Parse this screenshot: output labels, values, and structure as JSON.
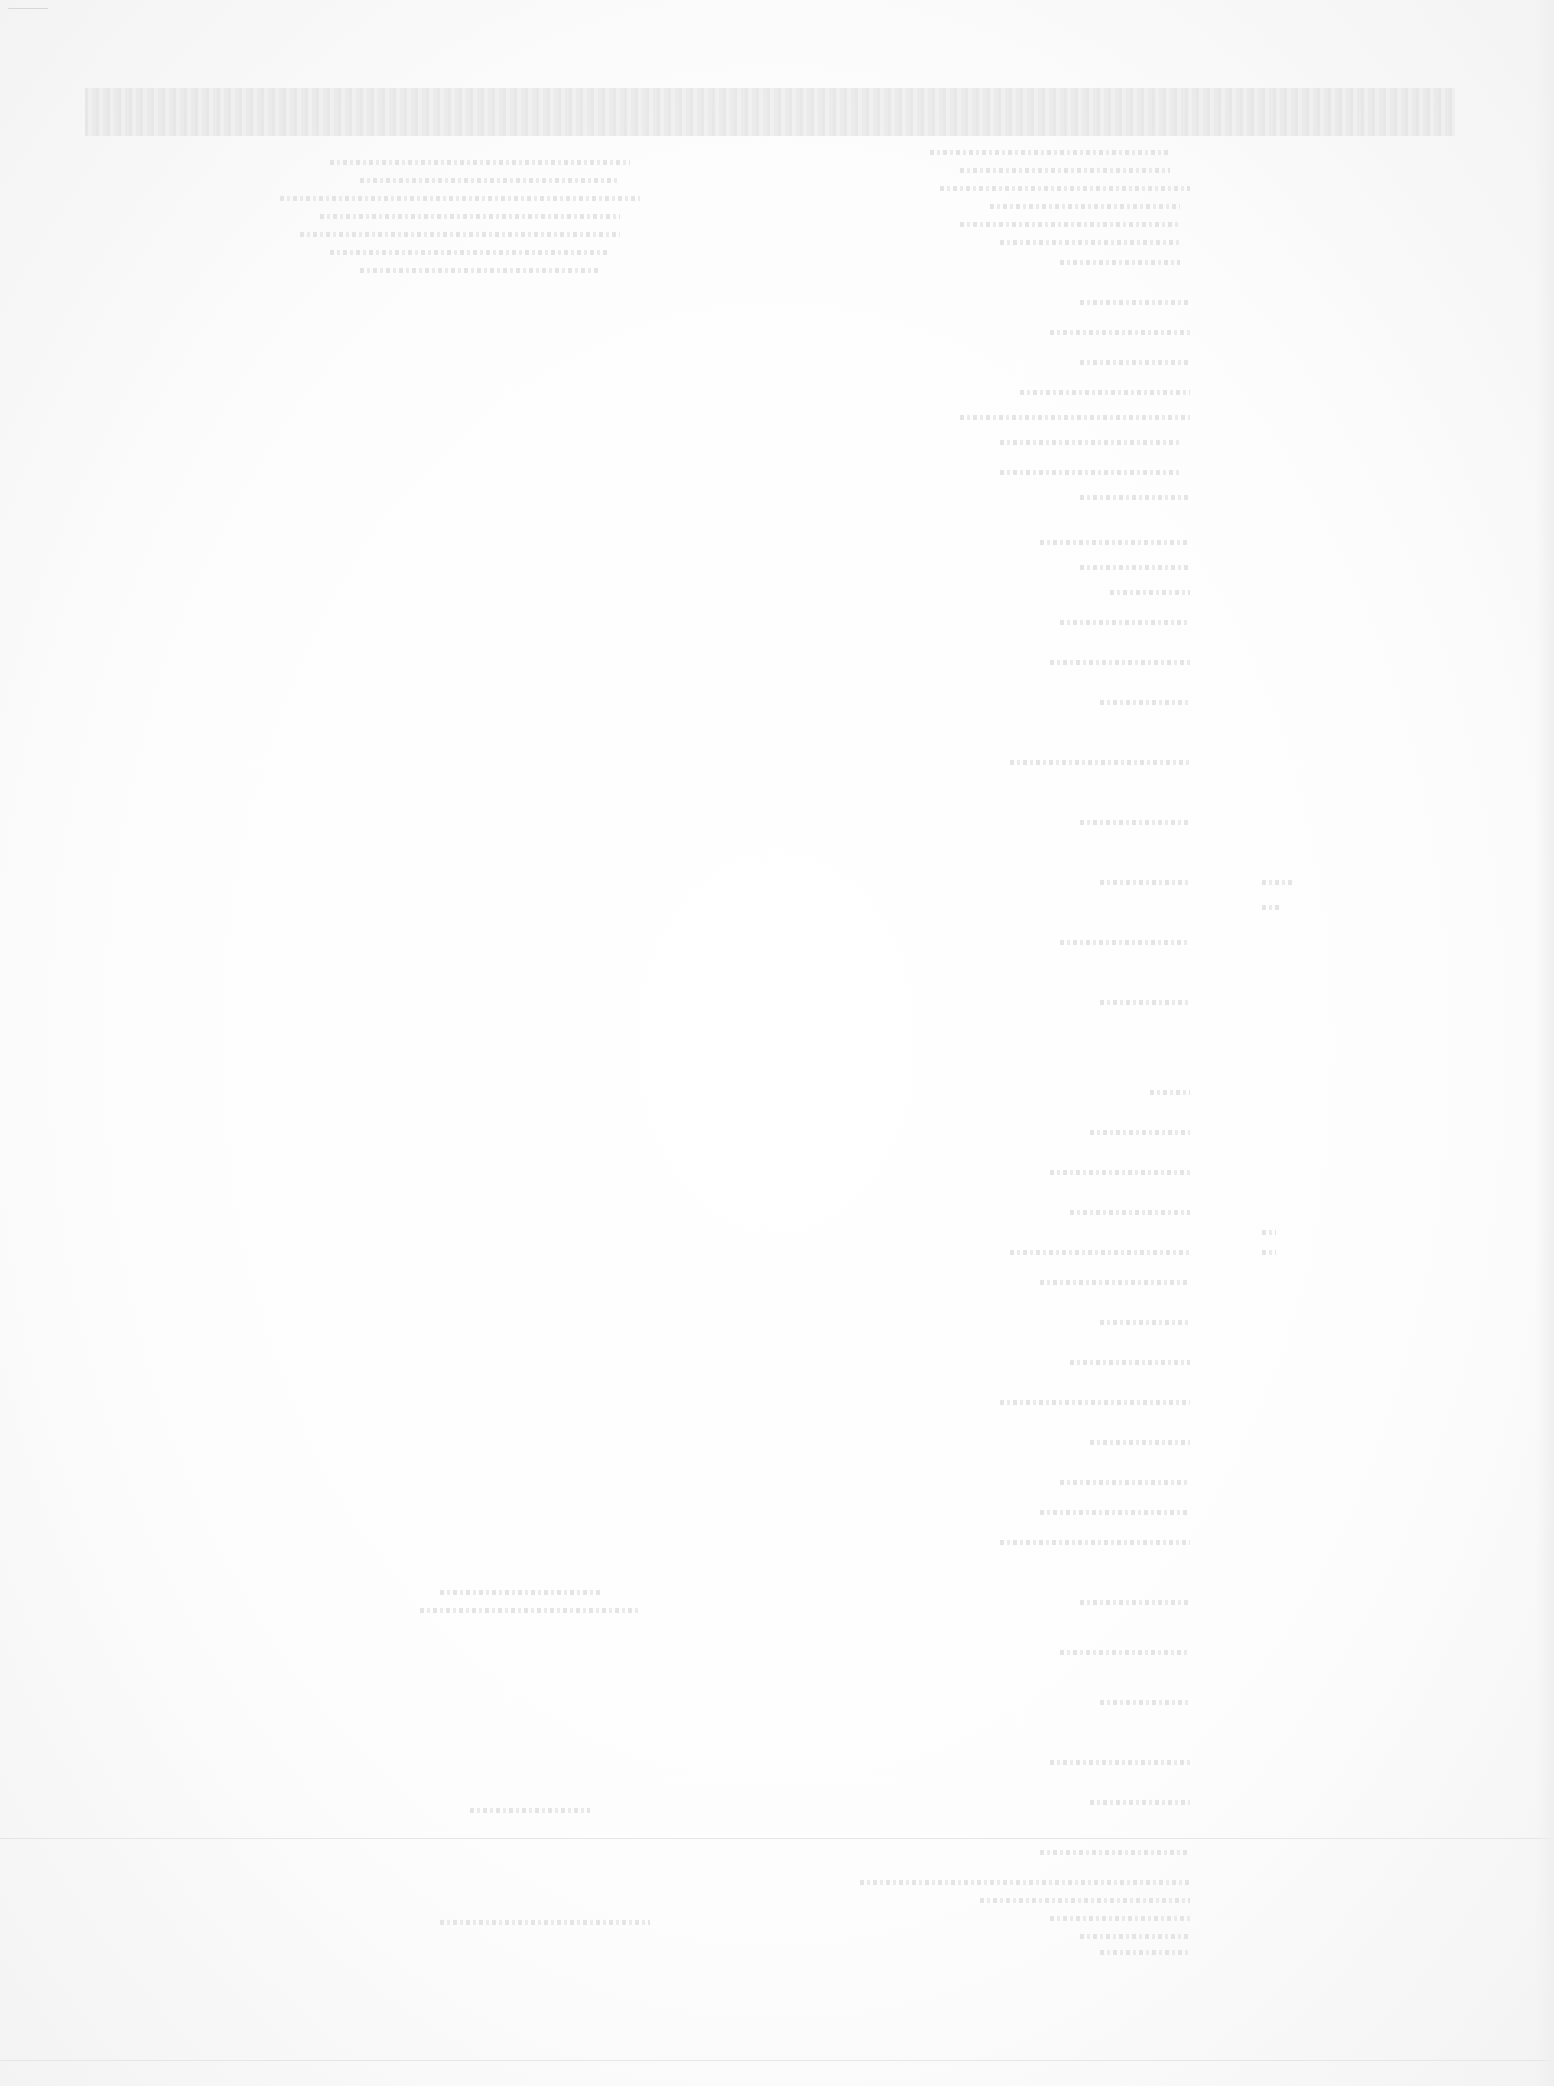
{
  "document": {
    "legibility": "illegible",
    "header_band": {
      "top": 88,
      "height": 48
    },
    "separator_rule_y": 1838,
    "left_column_lines": [
      {
        "x": 330,
        "y": 160,
        "w": 300
      },
      {
        "x": 360,
        "y": 178,
        "w": 260
      },
      {
        "x": 280,
        "y": 196,
        "w": 360
      },
      {
        "x": 320,
        "y": 214,
        "w": 300
      },
      {
        "x": 300,
        "y": 232,
        "w": 320
      },
      {
        "x": 330,
        "y": 250,
        "w": 280
      },
      {
        "x": 360,
        "y": 268,
        "w": 240
      },
      {
        "x": 440,
        "y": 1590,
        "w": 160
      },
      {
        "x": 420,
        "y": 1608,
        "w": 220
      },
      {
        "x": 470,
        "y": 1808,
        "w": 120
      },
      {
        "x": 440,
        "y": 1920,
        "w": 210
      }
    ],
    "right_column_lines": [
      {
        "x": 930,
        "y": 150,
        "w": 240
      },
      {
        "x": 960,
        "y": 168,
        "w": 210
      },
      {
        "x": 940,
        "y": 186,
        "w": 250
      },
      {
        "x": 990,
        "y": 204,
        "w": 190
      },
      {
        "x": 960,
        "y": 222,
        "w": 220
      },
      {
        "x": 1000,
        "y": 240,
        "w": 180
      },
      {
        "x": 1060,
        "y": 260,
        "w": 120
      },
      {
        "x": 1080,
        "y": 300,
        "w": 110
      },
      {
        "x": 1050,
        "y": 330,
        "w": 140
      },
      {
        "x": 1080,
        "y": 360,
        "w": 110
      },
      {
        "x": 1020,
        "y": 390,
        "w": 170
      },
      {
        "x": 960,
        "y": 415,
        "w": 230
      },
      {
        "x": 1000,
        "y": 440,
        "w": 180
      },
      {
        "x": 1000,
        "y": 470,
        "w": 180
      },
      {
        "x": 1080,
        "y": 495,
        "w": 110
      },
      {
        "x": 1040,
        "y": 540,
        "w": 150
      },
      {
        "x": 1080,
        "y": 565,
        "w": 110
      },
      {
        "x": 1110,
        "y": 590,
        "w": 80
      },
      {
        "x": 1060,
        "y": 620,
        "w": 130
      },
      {
        "x": 1050,
        "y": 660,
        "w": 140
      },
      {
        "x": 1100,
        "y": 700,
        "w": 90
      },
      {
        "x": 1010,
        "y": 760,
        "w": 180
      },
      {
        "x": 1080,
        "y": 820,
        "w": 110
      },
      {
        "x": 1100,
        "y": 880,
        "w": 90
      },
      {
        "x": 1060,
        "y": 940,
        "w": 130
      },
      {
        "x": 1100,
        "y": 1000,
        "w": 90
      },
      {
        "x": 1150,
        "y": 1090,
        "w": 40
      },
      {
        "x": 1090,
        "y": 1130,
        "w": 100
      },
      {
        "x": 1050,
        "y": 1170,
        "w": 140
      },
      {
        "x": 1070,
        "y": 1210,
        "w": 120
      },
      {
        "x": 1010,
        "y": 1250,
        "w": 180
      },
      {
        "x": 1040,
        "y": 1280,
        "w": 150
      },
      {
        "x": 1100,
        "y": 1320,
        "w": 90
      },
      {
        "x": 1070,
        "y": 1360,
        "w": 120
      },
      {
        "x": 1000,
        "y": 1400,
        "w": 190
      },
      {
        "x": 1090,
        "y": 1440,
        "w": 100
      },
      {
        "x": 1060,
        "y": 1480,
        "w": 130
      },
      {
        "x": 1040,
        "y": 1510,
        "w": 150
      },
      {
        "x": 1000,
        "y": 1540,
        "w": 190
      },
      {
        "x": 1080,
        "y": 1600,
        "w": 110
      },
      {
        "x": 1060,
        "y": 1650,
        "w": 130
      },
      {
        "x": 1100,
        "y": 1700,
        "w": 90
      },
      {
        "x": 1050,
        "y": 1760,
        "w": 140
      },
      {
        "x": 1090,
        "y": 1800,
        "w": 100
      },
      {
        "x": 1040,
        "y": 1850,
        "w": 150
      },
      {
        "x": 860,
        "y": 1880,
        "w": 330
      },
      {
        "x": 980,
        "y": 1898,
        "w": 210
      },
      {
        "x": 1050,
        "y": 1916,
        "w": 140
      },
      {
        "x": 1080,
        "y": 1934,
        "w": 110
      },
      {
        "x": 1100,
        "y": 1950,
        "w": 90
      }
    ],
    "margin_marks": [
      {
        "x": 1262,
        "y": 880,
        "w": 30
      },
      {
        "x": 1262,
        "y": 905,
        "w": 20
      },
      {
        "x": 1262,
        "y": 1230,
        "w": 14
      },
      {
        "x": 1262,
        "y": 1250,
        "w": 14
      }
    ]
  }
}
